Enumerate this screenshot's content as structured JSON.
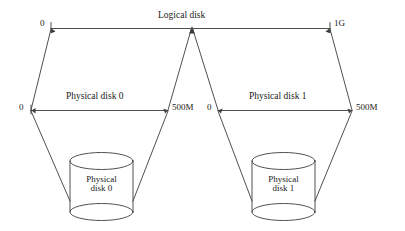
{
  "diagram": {
    "stroke_color": "#3c3c3c",
    "text_color": "#1a1a1a",
    "background_color": "#ffffff",
    "logical": {
      "name": "Logical disk",
      "label": "Logical disk",
      "start_label": "0",
      "end_label": "1G",
      "midpoint_marker": "arrowhead-up"
    },
    "physical": [
      {
        "name": "Physical disk 0",
        "label": "Physical disk 0",
        "start_label": "0",
        "end_label": "500M",
        "cylinder_line1": "Physical",
        "cylinder_line2": "disk 0"
      },
      {
        "name": "Physical disk 1",
        "label": "Physical disk 1",
        "start_label": "0",
        "end_label": "500M",
        "cylinder_line1": "Physical",
        "cylinder_line2": "disk 1"
      }
    ]
  }
}
